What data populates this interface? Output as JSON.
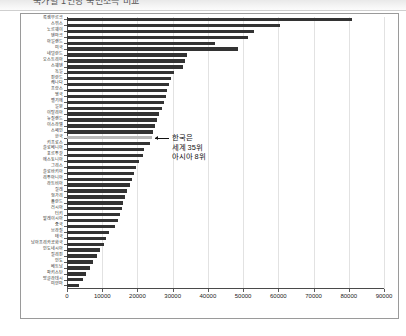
{
  "titlebar": {
    "text": "국가별 1인당 국민소득 비교"
  },
  "annotation": {
    "line1": "한국은",
    "line2": "세계 35위",
    "line3": "아시아 8위"
  },
  "chart_data": {
    "type": "bar",
    "orientation": "horizontal",
    "title": "국가별 1인당 국민소득 비교",
    "xlabel": "",
    "ylabel": "",
    "xlim": [
      0,
      90000
    ],
    "xticks": [
      0,
      10000,
      20000,
      30000,
      40000,
      50000,
      60000,
      70000,
      80000,
      90000
    ],
    "xticklabels": [
      "0",
      "10000",
      "20000",
      "30000",
      "40000",
      "50000",
      "60000",
      "70000",
      "80000",
      "90000"
    ],
    "grid": true,
    "grid_axis": "x",
    "legend": false,
    "bar_color": "#333333",
    "highlight_color": "#b9b9b9",
    "highlight_category": "한국",
    "categories": [
      "룩셈부르크",
      "스위스",
      "노르웨이",
      "덴마크",
      "아일랜드",
      "미국",
      "네덜란드",
      "오스트리아",
      "스웨덴",
      "독일",
      "핀란드",
      "캐나다",
      "프랑스",
      "영국",
      "벨기에",
      "일본",
      "이탈리아",
      "뉴질랜드",
      "이스라엘",
      "스페인",
      "한국",
      "키프로스",
      "슬로베니아",
      "포르투갈",
      "에스토니아",
      "그리스",
      "슬로바키아",
      "리투아니아",
      "라트비아",
      "칠레",
      "헝가리",
      "폴란드",
      "러시아",
      "터키",
      "말레이시아",
      "중국",
      "브라질",
      "태국",
      "남아프리카공화국",
      "인도네시아",
      "필리핀",
      "인도",
      "베트남",
      "파키스탄",
      "방글라데시",
      "미얀마"
    ],
    "values": [
      81000,
      60500,
      53000,
      51500,
      42000,
      48500,
      34000,
      33500,
      33000,
      30500,
      29500,
      29000,
      28500,
      28000,
      27500,
      27000,
      26000,
      25500,
      25000,
      24500,
      24000,
      23500,
      22000,
      21500,
      20500,
      19500,
      19000,
      18500,
      18000,
      17000,
      16500,
      16000,
      15500,
      15000,
      14500,
      13500,
      12000,
      11000,
      10500,
      9500,
      8500,
      7500,
      6500,
      5500,
      4500,
      3500
    ]
  }
}
